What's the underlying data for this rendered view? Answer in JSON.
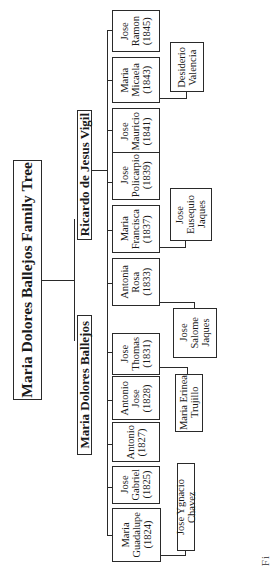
{
  "title": "Maria Dolores Ballejos Family Tree",
  "parents": {
    "mother": "Maria Dolores Ballejos",
    "father": "Ricardo de Jesus Vigil"
  },
  "children": [
    {
      "name": "Maria\nGuadalupe\n(1824)",
      "spouse": "Jose Ygnacio Chavez"
    },
    {
      "name": "Jose\nGabriel\n(1825)"
    },
    {
      "name": "Antonio\n(1827)"
    },
    {
      "name": "Antonio\nJose\n(1828)"
    },
    {
      "name": "Jose\nThomas\n(1831)",
      "spouse": "Maria Erinea\nTrujillo"
    },
    {
      "name": "Antonia\nRosa\n(1833)",
      "spouse": "Jose\nSalome\nJaques"
    },
    {
      "name": "Maria\nFrancisca\n(1837)",
      "spouse": "Jose\nEusequio\nJaques"
    },
    {
      "name": "Jose\nPolicarpio\n(1839)"
    },
    {
      "name": "Jose\nMauricio\n(1841)"
    },
    {
      "name": "Maria\nMicaela\n(1843)",
      "spouse": "Desiderio\nValencia"
    },
    {
      "name": "Jose\nRamon\n(1845)"
    }
  ],
  "caption_fragment": "Fi"
}
